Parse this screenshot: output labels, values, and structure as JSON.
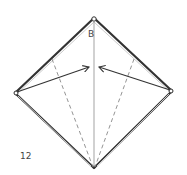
{
  "diagram": {
    "type": "origami-step",
    "step_number": "12",
    "point_label": "B",
    "colors": {
      "outline": "#333333",
      "outline_inner": "#bbbbbb",
      "fold_line": "#999999",
      "valley_fold": "#888888",
      "arrow": "#333333",
      "text": "#444444"
    },
    "elements": [
      "diamond-outline",
      "center-crease",
      "valley-fold-left",
      "valley-fold-right",
      "fold-arrow-left",
      "fold-arrow-right"
    ]
  }
}
